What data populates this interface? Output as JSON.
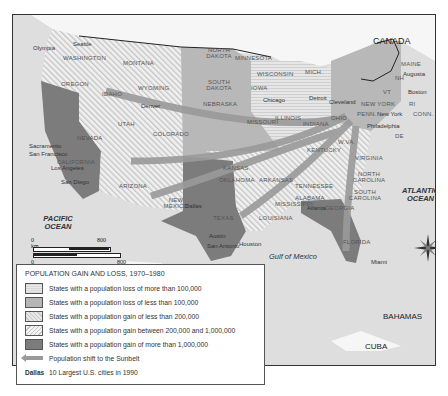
{
  "map": {
    "title": "Population Gain and Loss, 1970–1980",
    "countries": {
      "canada": "CANADA",
      "mexico": "MEXICO",
      "bahamas": "BAHAMAS",
      "cuba": "CUBA"
    },
    "water": {
      "pacific": "PACIFIC OCEAN",
      "atlantic": "ATLANTIC OCEAN",
      "gulf": "Gulf of Mexico"
    },
    "states": {
      "washington": "WASHINGTON",
      "oregon": "OREGON",
      "california": "CALIFORNIA",
      "nevada": "NEVADA",
      "idaho": "IDAHO",
      "montana": "MONTANA",
      "wyoming": "WYOMING",
      "utah": "UTAH",
      "colorado": "COLORADO",
      "arizona": "ARIZONA",
      "new_mexico": "NEW MEXICO",
      "north_dakota": "NORTH DAKOTA",
      "south_dakota": "SOUTH DAKOTA",
      "nebraska": "NEBRASKA",
      "kansas": "KANSAS",
      "oklahoma": "OKLAHOMA",
      "texas": "TEXAS",
      "minnesota": "MINNESOTA",
      "iowa": "IOWA",
      "missouri": "MISSOURI",
      "arkansas": "ARKANSAS",
      "louisiana": "LOUISIANA",
      "wisconsin": "WISCONSIN",
      "illinois": "ILLINOIS",
      "michigan": "MICH.",
      "indiana": "INDIANA",
      "ohio": "OHIO",
      "kentucky": "KENTUCKY",
      "tennessee": "TENNESSEE",
      "mississippi": "MISSISSIPPI",
      "alabama": "ALABAMA",
      "georgia": "GEORGIA",
      "florida": "FLORIDA",
      "south_carolina": "SOUTH CAROLINA",
      "north_carolina": "NORTH CAROLINA",
      "virginia": "VIRGINIA",
      "west_virginia": "W.VA.",
      "penn": "PENN.",
      "new_york": "NEW YORK",
      "maine": "MAINE",
      "vt": "VT",
      "nh": "NH",
      "mass": "MASS.",
      "conn": "CONN.",
      "ri": "RI",
      "de": "DE",
      "md": "MD",
      "nj": "NJ"
    },
    "cities": {
      "seattle": "Seattle",
      "olympia": "Olympia",
      "salem": "Salem",
      "boise": "Boise",
      "helena": "Helena",
      "sacramento": "Sacramento",
      "carson_city": "Carson City",
      "san_francisco": "San Francisco",
      "salt_lake_city": "Salt Lake City",
      "cheyenne": "Cheyenne",
      "denver": "Denver",
      "los_angeles": "Los Angeles",
      "san_diego": "San Diego",
      "phoenix": "Phoenix",
      "santa_fe": "Santa Fe",
      "bismarck": "Bismarck",
      "pierre": "Pierre",
      "lincoln": "Lincoln",
      "topeka": "Topeka",
      "oklahoma_city": "Oklahoma City",
      "dallas": "Dallas",
      "austin": "Austin",
      "san_antonio": "San Antonio",
      "houston": "Houston",
      "st_paul": "St.Paul",
      "des_moines": "Des Moines",
      "jefferson_city": "Jefferson City",
      "little_rock": "Little Rock",
      "baton_rouge": "Baton Rouge",
      "jackson": "Jackson",
      "madison": "Madison",
      "chicago": "Chicago",
      "springfield": "Springfield",
      "st_louis": "St. Louis",
      "lansing": "Lansing",
      "detroit": "Detroit",
      "indianapolis": "Indianapolis",
      "columbus": "Columbus",
      "cleveland": "Cleveland",
      "frankfort": "Frankfort",
      "nashville": "Nashville",
      "montgomery": "Montgomery",
      "atlanta": "Atlanta",
      "tallahassee": "Tallahassee",
      "miami": "Miami",
      "columbia": "Columbia",
      "raleigh": "Raleigh",
      "richmond": "Richmond",
      "charleston": "Charleston",
      "harrisburg": "Harrisburg",
      "philadelphia": "Philadelphia",
      "annapolis": "Annapolis",
      "washington_dc": "Washington, D.C.",
      "dover": "Dover",
      "trenton": "Trenton",
      "new_york": "New York",
      "albany": "Albany",
      "hartford": "Hartford",
      "providence": "Providence",
      "boston": "Boston",
      "concord": "Concord",
      "montpelier": "Montpelier",
      "augusta": "Augusta"
    },
    "scale": {
      "km_zero": "0 km",
      "km_max": "800",
      "mi_zero": "0 miles",
      "mi_max": "800"
    },
    "compass": {
      "n": "N",
      "s": "S",
      "e": "E",
      "w": "W"
    }
  },
  "legend": {
    "title": "POPULATION GAIN AND LOSS, 1970–1980",
    "items": [
      {
        "label": "States with a population loss of more than 100,000",
        "color": "#dcdcdc"
      },
      {
        "label": "States with a population loss of less than 100,000",
        "color": "#b5b5b5"
      },
      {
        "label": "States with a population gain of less than 200,000",
        "color": "#d6d6d6"
      },
      {
        "label": "States with a population gain between 200,000 and 1,000,000",
        "color": "#e0e0e0"
      },
      {
        "label": "States with a population gain of more than 1,000,000",
        "color": "#7c7c7c"
      }
    ],
    "arrow_label": "Population shift to the Sunbelt",
    "city_key": "Dallas",
    "city_key_label": "10 Largest U.S. cities in 1990"
  },
  "caption": "Population Shifts, 1970–1980"
}
